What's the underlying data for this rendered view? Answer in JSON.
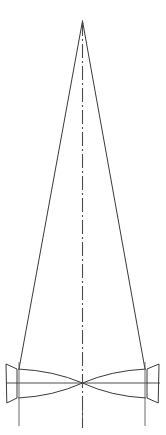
{
  "figure": {
    "title": "",
    "type": "optical-ray-diagram",
    "background_color": "#ffffff",
    "line_color": "#3a3a3a",
    "axis_color": "#4a4a4a",
    "width": 166,
    "height": 435
  },
  "optical_axis": {
    "label": "vertical-optical-axis",
    "x": 82.5,
    "y_top": 22,
    "y_bottom": 428,
    "dash_pattern": "14,3,2,3",
    "stroke_width": 1.1
  },
  "horizontal_axis": {
    "label": "horizontal-optical-axis",
    "y": 383,
    "x_left": 6,
    "x_right": 160,
    "stroke_width": 0.9
  },
  "cone": {
    "label": "converging-ray-cone",
    "apex_x": 82.5,
    "apex_y": 21,
    "left_base_x": 19,
    "right_base_x": 145,
    "base_y": 369,
    "stroke_width": 1.0
  },
  "lenses": [
    {
      "name": "left-lens-element",
      "side": "left",
      "outer_x": 6,
      "inner_x": 19,
      "top_y": 365,
      "bottom_y": 402,
      "waist_x": 82.5,
      "waist_y": 383,
      "mount_line_x": 19,
      "mount_top_y": 362,
      "mount_bottom_y": 426
    },
    {
      "name": "right-lens-element",
      "side": "right",
      "outer_x": 159,
      "inner_x": 145,
      "top_y": 365,
      "bottom_y": 402,
      "waist_x": 82.5,
      "waist_y": 383,
      "mount_line_x": 145,
      "mount_top_y": 362,
      "mount_bottom_y": 426
    }
  ],
  "beam_waist": {
    "label": "beam-waist-crossover",
    "x": 82.5,
    "y": 383
  },
  "mount_lines": [
    {
      "name": "left-mount-line",
      "x": 19,
      "y_top": 362,
      "y_bottom": 426
    },
    {
      "name": "center-mount-line",
      "x": 82.5,
      "y_top": 404,
      "y_bottom": 428
    },
    {
      "name": "right-mount-line",
      "x": 145,
      "y_top": 362,
      "y_bottom": 426
    }
  ],
  "annotations": []
}
